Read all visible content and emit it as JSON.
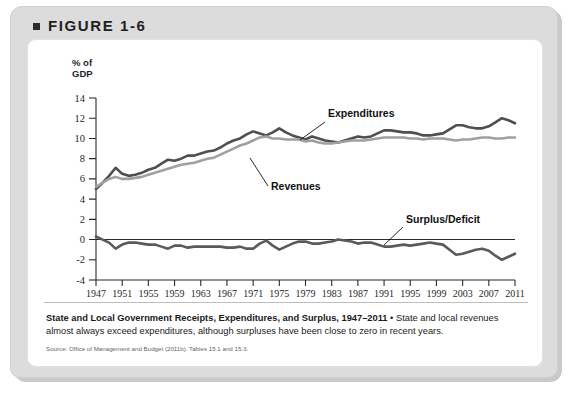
{
  "figure": {
    "label": "FIGURE 1-6",
    "bullet_icon": "square-bullet-icon"
  },
  "caption": {
    "lead": "State and Local Government Receipts, Expenditures, and Surplus, 1947–2011",
    "separator": " • ",
    "body": "State and local revenues almost always exceed expenditures, although surpluses have been close to zero in recent years.",
    "source": "Source: Office of Management and Budget (2011b). Tables 15.1 and 15.3."
  },
  "colors": {
    "expenditures": "#4f4f4f",
    "revenues": "#a0a0a0",
    "surplus": "#5a5a5a",
    "axis": "#2b2b2b",
    "card": "#dcdcdc",
    "panel": "#ffffff"
  },
  "chart_data": {
    "type": "line",
    "title": "State and Local Government Receipts, Expenditures, and Surplus, 1947–2011",
    "xlabel": "",
    "ylabel": "% of GDP",
    "ylim": [
      -4,
      14
    ],
    "xlim": [
      1947,
      2011
    ],
    "grid": false,
    "legend": "inline-annotations",
    "yticks": [
      -4,
      -2,
      0,
      2,
      4,
      6,
      8,
      10,
      12,
      14
    ],
    "ytick_labels": [
      "-4",
      "-2",
      "0",
      "2",
      "4",
      "6",
      "8",
      "10",
      "12",
      "14"
    ],
    "xticks": [
      1947,
      1951,
      1955,
      1959,
      1963,
      1967,
      1971,
      1975,
      1979,
      1983,
      1987,
      1991,
      1995,
      1999,
      2003,
      2007,
      2011
    ],
    "xtick_labels": [
      "1947",
      "1951",
      "1955",
      "1959",
      "1963",
      "1967",
      "1971",
      "1975",
      "1979",
      "1983",
      "1987",
      "1991",
      "1995",
      "1999",
      "2003",
      "2007",
      "2011"
    ],
    "annotations": [
      {
        "text": "Expenditures",
        "series": "Expenditures"
      },
      {
        "text": "Revenues",
        "series": "Revenues"
      },
      {
        "text": "Surplus/Deficit",
        "series": "Surplus/Deficit"
      }
    ],
    "x": [
      1947,
      1948,
      1949,
      1950,
      1951,
      1952,
      1953,
      1954,
      1955,
      1956,
      1957,
      1958,
      1959,
      1960,
      1961,
      1962,
      1963,
      1964,
      1965,
      1966,
      1967,
      1968,
      1969,
      1970,
      1971,
      1972,
      1973,
      1974,
      1975,
      1976,
      1977,
      1978,
      1979,
      1980,
      1981,
      1982,
      1983,
      1984,
      1985,
      1986,
      1987,
      1988,
      1989,
      1990,
      1991,
      1992,
      1993,
      1994,
      1995,
      1996,
      1997,
      1998,
      1999,
      2000,
      2001,
      2002,
      2003,
      2004,
      2005,
      2006,
      2007,
      2008,
      2009,
      2010,
      2011
    ],
    "series": [
      {
        "name": "Expenditures",
        "color": "#4f4f4f",
        "values": [
          5.0,
          5.6,
          6.3,
          7.1,
          6.5,
          6.3,
          6.4,
          6.6,
          6.9,
          7.1,
          7.5,
          7.9,
          7.8,
          8.0,
          8.3,
          8.3,
          8.5,
          8.7,
          8.8,
          9.1,
          9.5,
          9.8,
          10.0,
          10.4,
          10.7,
          10.5,
          10.3,
          10.6,
          11.0,
          10.6,
          10.3,
          10.1,
          9.9,
          10.2,
          10.0,
          9.8,
          9.7,
          9.6,
          9.8,
          10.0,
          10.2,
          10.1,
          10.2,
          10.5,
          10.8,
          10.8,
          10.7,
          10.6,
          10.6,
          10.5,
          10.3,
          10.3,
          10.4,
          10.5,
          10.9,
          11.3,
          11.3,
          11.1,
          11.0,
          11.0,
          11.2,
          11.6,
          12.0,
          11.8,
          11.5
        ]
      },
      {
        "name": "Revenues",
        "color": "#a0a0a0",
        "values": [
          5.2,
          5.6,
          6.0,
          6.2,
          6.0,
          6.0,
          6.1,
          6.2,
          6.4,
          6.6,
          6.8,
          7.0,
          7.2,
          7.4,
          7.5,
          7.6,
          7.8,
          8.0,
          8.1,
          8.4,
          8.7,
          9.0,
          9.3,
          9.5,
          9.8,
          10.1,
          10.2,
          10.0,
          10.0,
          9.9,
          9.9,
          9.9,
          9.7,
          9.8,
          9.6,
          9.5,
          9.5,
          9.6,
          9.7,
          9.8,
          9.8,
          9.8,
          9.9,
          10.0,
          10.1,
          10.1,
          10.1,
          10.1,
          10.0,
          10.0,
          9.9,
          10.0,
          10.0,
          10.0,
          9.9,
          9.8,
          9.9,
          9.9,
          10.0,
          10.1,
          10.1,
          10.0,
          10.0,
          10.1,
          10.1
        ]
      },
      {
        "name": "Surplus/Deficit",
        "color": "#5a5a5a",
        "values": [
          0.3,
          0.0,
          -0.3,
          -0.9,
          -0.5,
          -0.3,
          -0.3,
          -0.4,
          -0.5,
          -0.5,
          -0.7,
          -0.9,
          -0.6,
          -0.6,
          -0.8,
          -0.7,
          -0.7,
          -0.7,
          -0.7,
          -0.7,
          -0.8,
          -0.8,
          -0.7,
          -0.9,
          -0.9,
          -0.4,
          -0.1,
          -0.6,
          -1.0,
          -0.7,
          -0.4,
          -0.2,
          -0.2,
          -0.4,
          -0.4,
          -0.3,
          -0.2,
          0.0,
          -0.1,
          -0.2,
          -0.4,
          -0.3,
          -0.3,
          -0.5,
          -0.7,
          -0.7,
          -0.6,
          -0.5,
          -0.6,
          -0.5,
          -0.4,
          -0.3,
          -0.4,
          -0.5,
          -1.0,
          -1.5,
          -1.4,
          -1.2,
          -1.0,
          -0.9,
          -1.1,
          -1.6,
          -2.0,
          -1.7,
          -1.4
        ]
      }
    ]
  }
}
